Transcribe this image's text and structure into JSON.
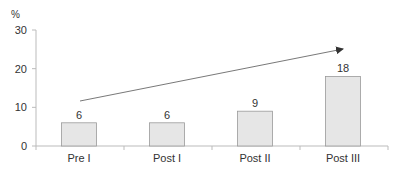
{
  "chart_data": {
    "type": "bar",
    "title": "",
    "xlabel": "",
    "ylabel": "%",
    "ylim": [
      0,
      30
    ],
    "yticks": [
      0,
      10,
      20,
      30
    ],
    "categories": [
      "Pre I",
      "Post I",
      "Post II",
      "Post III"
    ],
    "values": [
      6,
      6,
      9,
      18
    ],
    "data_labels": [
      "6",
      "6",
      "9",
      "18"
    ],
    "annotations": [
      {
        "type": "arrow",
        "description": "upward trend arrow from Pre I to Post III",
        "from_category": "Pre I",
        "to_category": "Post III"
      }
    ],
    "grid": false,
    "legend": null,
    "colors": {
      "bar_fill": "#e6e6e6",
      "bar_stroke": "#9a9a9a",
      "axis": "#bbbbbb",
      "arrow": "#333333",
      "text": "#333333"
    }
  },
  "axis": {
    "y_unit_label": "%",
    "y_tick_labels": [
      "0",
      "10",
      "20",
      "30"
    ]
  }
}
